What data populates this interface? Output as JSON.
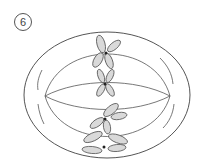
{
  "figure": {
    "label": "6",
    "chromosome_count": 4,
    "colors": {
      "outline": "#555555",
      "chromosome_fill": "#d9d9d9",
      "centromere": "#222222",
      "background": "#ffffff"
    }
  }
}
